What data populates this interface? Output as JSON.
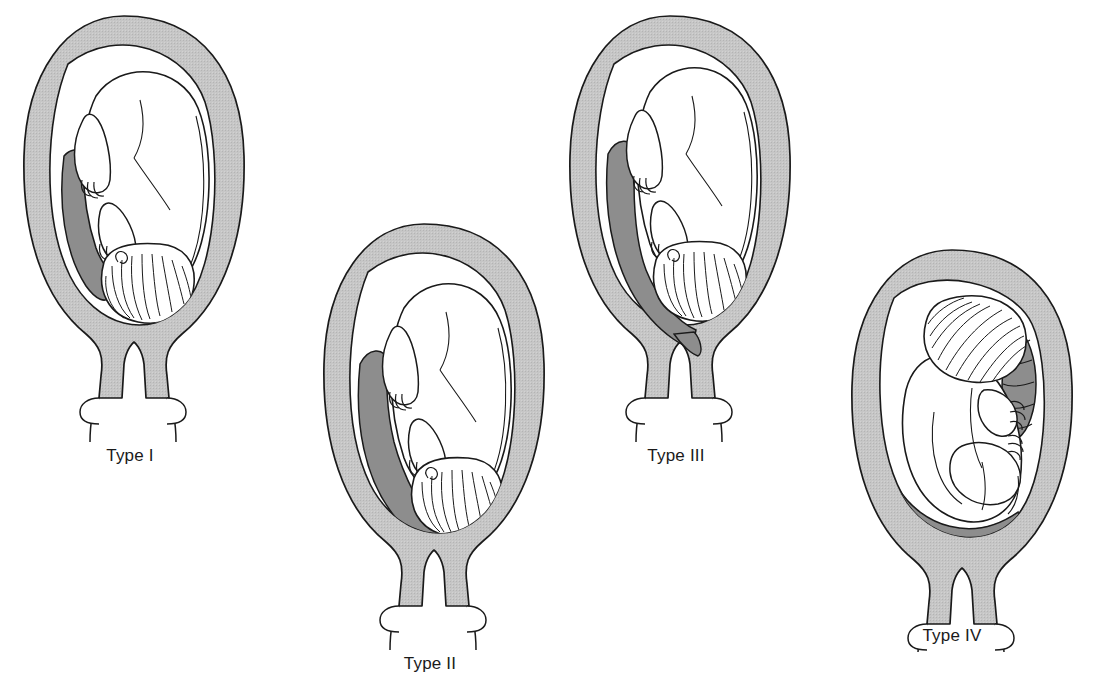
{
  "figure": {
    "background_color": "#ffffff",
    "ink_color": "#1a1a1a",
    "uterine_wall_color": "#c3c3c3",
    "placenta_color": "#8d8d8d",
    "fetus_fill_color": "#ffffff",
    "panel_count": 4
  },
  "panels": [
    {
      "id": "type-1",
      "label": "Type I",
      "label_x": 150,
      "label_y": 456,
      "anatomy": {
        "uterus": "gravid uterus, fundus up",
        "fetus_presentation": "cephalic, vertex down, back to the left",
        "placenta_site": "low lying on the left lateral wall, lower edge does not reach the internal os",
        "cervix": "closed, shaded",
        "vagina": "open outline below cervix"
      }
    },
    {
      "id": "type-2",
      "label": "Type II",
      "label_x": 430,
      "label_y": 652,
      "anatomy": {
        "uterus": "gravid uterus, fundus up",
        "fetus_presentation": "cephalic, vertex down, back to the left",
        "placenta_site": "marginal, lower edge reaches the margin of the internal os",
        "cervix": "closed, shaded",
        "vagina": "open outline below cervix"
      }
    },
    {
      "id": "type-3",
      "label": "Type III",
      "label_x": 696,
      "label_y": 456,
      "anatomy": {
        "uterus": "gravid uterus, fundus up",
        "fetus_presentation": "cephalic, vertex down, back to the left",
        "placenta_site": "partial previa, placenta covers part of the internal os asymmetrically",
        "cervix": "closed, shaded",
        "vagina": "open outline below cervix"
      }
    },
    {
      "id": "type-4",
      "label": "Type IV",
      "label_x": 968,
      "label_y": 652,
      "anatomy": {
        "uterus": "gravid uterus, fundus up",
        "fetus_presentation": "oblique / transverse, head to the upper right, body flexed",
        "placenta_site": "complete central previa, placenta completely covers the internal os and extends up the right wall",
        "cervix": "closed, shaded",
        "vagina": "open outline below cervix"
      }
    }
  ]
}
